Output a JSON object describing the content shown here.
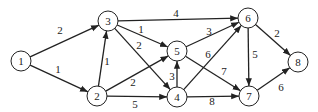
{
  "graph": {
    "directed": true,
    "node_radius": 10,
    "colors": {
      "stroke": "#222222",
      "fill": "#ffffff",
      "background": "#ffffff"
    },
    "nodes": [
      {
        "id": "1",
        "label": "1",
        "x": 21,
        "y": 61
      },
      {
        "id": "2",
        "label": "2",
        "x": 97,
        "y": 96
      },
      {
        "id": "3",
        "label": "3",
        "x": 108,
        "y": 21
      },
      {
        "id": "4",
        "label": "4",
        "x": 177,
        "y": 97
      },
      {
        "id": "5",
        "label": "5",
        "x": 177,
        "y": 51
      },
      {
        "id": "6",
        "label": "6",
        "x": 248,
        "y": 18
      },
      {
        "id": "7",
        "label": "7",
        "x": 249,
        "y": 96
      },
      {
        "id": "8",
        "label": "8",
        "x": 298,
        "y": 62
      }
    ],
    "edges": [
      {
        "from": "1",
        "to": "3",
        "weight": "2",
        "lx": 60,
        "ly": 34
      },
      {
        "from": "1",
        "to": "2",
        "weight": "1",
        "lx": 58,
        "ly": 73
      },
      {
        "from": "2",
        "to": "3",
        "weight": "1",
        "lx": 107,
        "ly": 65
      },
      {
        "from": "2",
        "to": "5",
        "weight": "2",
        "lx": 133,
        "ly": 86
      },
      {
        "from": "2",
        "to": "4",
        "weight": "5",
        "lx": 135,
        "ly": 108
      },
      {
        "from": "3",
        "to": "6",
        "weight": "4",
        "lx": 176,
        "ly": 17
      },
      {
        "from": "3",
        "to": "5",
        "weight": "1",
        "lx": 141,
        "ly": 33
      },
      {
        "from": "3",
        "to": "4",
        "weight": "2",
        "lx": 139,
        "ly": 49
      },
      {
        "from": "4",
        "to": "5",
        "weight": "3",
        "lx": 172,
        "ly": 80
      },
      {
        "from": "4",
        "to": "6",
        "weight": "6",
        "lx": 208,
        "ly": 58
      },
      {
        "from": "4",
        "to": "7",
        "weight": "8",
        "lx": 212,
        "ly": 105
      },
      {
        "from": "5",
        "to": "6",
        "weight": "3",
        "lx": 209,
        "ly": 35
      },
      {
        "from": "5",
        "to": "7",
        "weight": "7",
        "lx": 224,
        "ly": 75
      },
      {
        "from": "6",
        "to": "7",
        "weight": "5",
        "lx": 255,
        "ly": 58
      },
      {
        "from": "6",
        "to": "8",
        "weight": "2",
        "lx": 277,
        "ly": 37
      },
      {
        "from": "7",
        "to": "8",
        "weight": "6",
        "lx": 281,
        "ly": 91
      }
    ]
  }
}
